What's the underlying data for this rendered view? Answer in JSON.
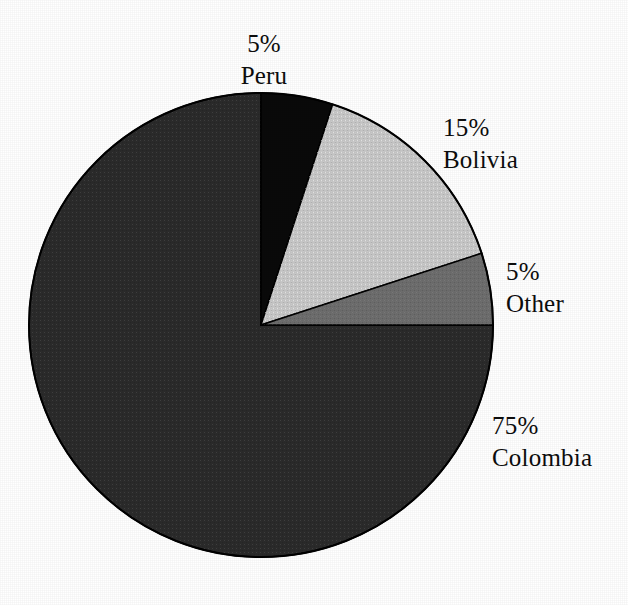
{
  "chart_data": {
    "type": "pie",
    "title": "",
    "subtitle": "",
    "xlabel": "",
    "ylabel": "",
    "legend_position": "none",
    "grid": false,
    "label_format": "{percent}% {category}",
    "start_angle_deg": -90,
    "direction": "clockwise",
    "categories": [
      "Peru",
      "Bolivia",
      "Other",
      "Colombia"
    ],
    "values": [
      5,
      15,
      5,
      75
    ],
    "units": "percent",
    "slices": [
      {
        "category": "Peru",
        "percent": 5,
        "percent_label": "5%",
        "color": "#0a0a0a",
        "start_deg": -90,
        "end_deg": -72,
        "label_position": "top"
      },
      {
        "category": "Bolivia",
        "percent": 15,
        "percent_label": "15%",
        "color": "#c9c9c9",
        "start_deg": -72,
        "end_deg": -18,
        "label_position": "upper-right"
      },
      {
        "category": "Other",
        "percent": 5,
        "percent_label": "5%",
        "color": "#6e6e6e",
        "start_deg": -18,
        "end_deg": 0,
        "label_position": "right"
      },
      {
        "category": "Colombia",
        "percent": 75,
        "percent_label": "75%",
        "color": "#2b2b2b",
        "start_deg": 0,
        "end_deg": 270,
        "label_position": "lower-right"
      }
    ]
  },
  "labels": {
    "peru": {
      "percent": "5%",
      "name": "Peru"
    },
    "bolivia": {
      "percent": "15%",
      "name": "Bolivia"
    },
    "other": {
      "percent": "5%",
      "name": "Other"
    },
    "colombia": {
      "percent": "75%",
      "name": "Colombia"
    }
  },
  "colors": {
    "background": "#ffffff",
    "outline": "#000000",
    "text": "#0d0d0d",
    "peru_slice": "#0a0a0a",
    "bolivia_slice": "#c9c9c9",
    "other_slice": "#6e6e6e",
    "colombia_slice": "#2b2b2b"
  },
  "geometry": {
    "center_x": 261,
    "center_y": 325,
    "radius": 232
  }
}
